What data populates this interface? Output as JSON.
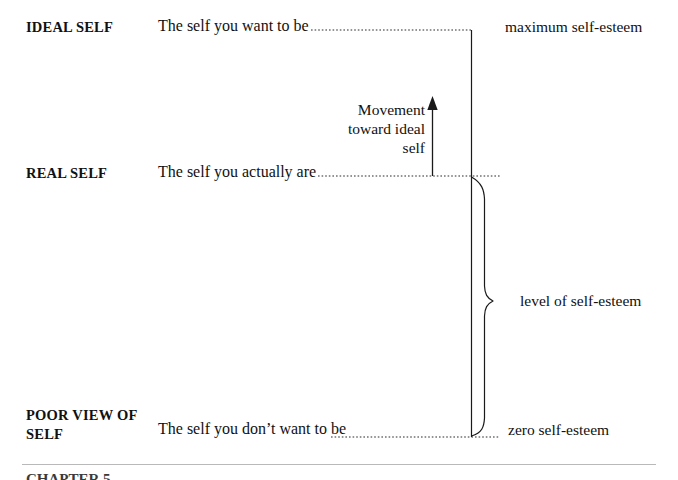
{
  "figure": {
    "type": "diagram",
    "background_color": "#ffffff",
    "line_color": "#1a1a1a",
    "rule_color": "#b9b9b9"
  },
  "stages": [
    {
      "id": "ideal",
      "label": "IDEAL SELF",
      "description": "The self you want to be",
      "right_label": "maximum self-esteem"
    },
    {
      "id": "real",
      "label": "REAL SELF",
      "description": "The self you actually are",
      "right_label": ""
    },
    {
      "id": "poor",
      "label": "POOR VIEW\nOF SELF",
      "description": "The self you don’t want to be",
      "right_label": "zero self-esteem"
    }
  ],
  "annotations": {
    "movement_arrow": "Movement\ntoward\nideal self",
    "brace_label": "level of self-esteem"
  },
  "footer": {
    "clipped_text": "CHAPTER 5"
  }
}
